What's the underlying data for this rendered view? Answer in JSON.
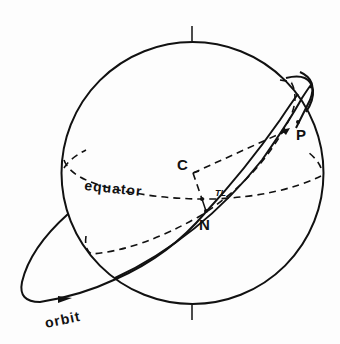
{
  "diagram": {
    "type": "celestial-sphere-orbit",
    "labels": {
      "center": "C",
      "node": "N",
      "point": "P",
      "equator": "equator",
      "orbit": "orbit",
      "angle": "TL"
    },
    "colors": {
      "ink": "#111111",
      "background": "#fdfdfd"
    }
  }
}
